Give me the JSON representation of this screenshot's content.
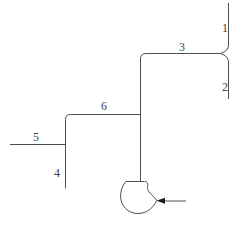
{
  "diagram": {
    "background_color": "#ffffff",
    "line_color": "#4f4f4f",
    "label_color": "#3f3f3f",
    "arrow_color": "#1a1a1a",
    "labels": [
      {
        "id": "stream-1",
        "text": "1"
      },
      {
        "id": "stream-2",
        "text": "2"
      },
      {
        "id": "stream-3",
        "text": "3"
      },
      {
        "id": "stream-4",
        "text": "4"
      },
      {
        "id": "stream-5",
        "text": "5"
      },
      {
        "id": "stream-6",
        "text": "6"
      }
    ],
    "symbols": [
      {
        "id": "pump",
        "name": "centrifugal-pump-symbol"
      },
      {
        "id": "inlet-arrow",
        "name": "flow-direction-arrow-left"
      }
    ]
  }
}
